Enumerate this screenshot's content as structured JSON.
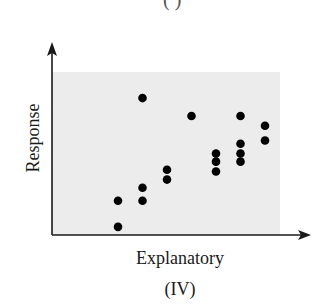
{
  "chart_data": {
    "type": "scatter",
    "title": "",
    "panel_label": "(IV)",
    "top_cropped_label": "( )",
    "xlabel": "Explanatory",
    "ylabel": "Response",
    "xlim": [
      0,
      8
    ],
    "ylim": [
      0,
      10
    ],
    "grid": false,
    "ticks": false,
    "legend": null,
    "background_color": "#ececec",
    "point_color": "#000000",
    "points": [
      {
        "x": 1,
        "y": 2.1
      },
      {
        "x": 1,
        "y": 0.5
      },
      {
        "x": 2,
        "y": 8.4
      },
      {
        "x": 2,
        "y": 2.9
      },
      {
        "x": 2,
        "y": 2.1
      },
      {
        "x": 3,
        "y": 4.0
      },
      {
        "x": 3,
        "y": 3.4
      },
      {
        "x": 4,
        "y": 7.3
      },
      {
        "x": 5,
        "y": 5.0
      },
      {
        "x": 5,
        "y": 4.5
      },
      {
        "x": 5,
        "y": 3.9
      },
      {
        "x": 6,
        "y": 7.3
      },
      {
        "x": 6,
        "y": 5.6
      },
      {
        "x": 6,
        "y": 5.0
      },
      {
        "x": 6,
        "y": 4.5
      },
      {
        "x": 7,
        "y": 6.7
      },
      {
        "x": 7,
        "y": 5.8
      }
    ]
  }
}
